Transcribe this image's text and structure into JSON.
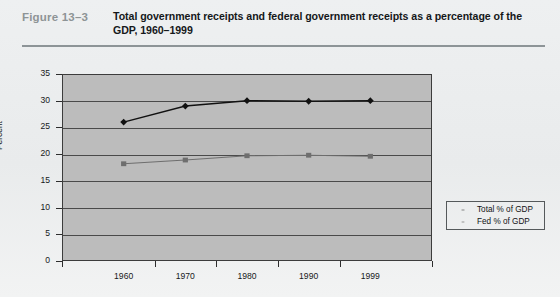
{
  "figure": {
    "label": "Figure 13–3",
    "title": "Total government receipts and federal government receipts as a percentage of the GDP, 1960–1999"
  },
  "colors": {
    "page_background": "#eceff0",
    "plot_background": "#bcbcbc",
    "gridline": "#4a4a4a",
    "total_series": "#111111",
    "fed_series": "#6e6e6e",
    "figure_label": "#8e9496",
    "title_text": "#15181a"
  },
  "chart_data": {
    "type": "line",
    "title": "Total government receipts and federal government receipts as a percentage of the GDP, 1960–1999",
    "xlabel": "",
    "ylabel": "Percent",
    "categories": [
      "1960",
      "1970",
      "1980",
      "1990",
      "1999"
    ],
    "ylim": [
      0,
      35
    ],
    "yticks": [
      0,
      5,
      10,
      15,
      20,
      25,
      30,
      35
    ],
    "ytick_labels": [
      "0",
      "5",
      "10",
      "15",
      "20",
      "25",
      "30",
      "35"
    ],
    "grid": true,
    "legend_position": "right",
    "series": [
      {
        "name": "Total % of GDP",
        "marker": "diamond",
        "color": "#111111",
        "values": [
          26.0,
          29.0,
          30.0,
          29.9,
          30.0
        ]
      },
      {
        "name": "Fed % of GDP",
        "marker": "square",
        "color": "#6e6e6e",
        "values": [
          18.2,
          18.9,
          19.7,
          19.8,
          19.6
        ]
      }
    ]
  },
  "legend": {
    "items": [
      {
        "label": "Total % of GDP"
      },
      {
        "label": "Fed % of GDP"
      }
    ]
  }
}
